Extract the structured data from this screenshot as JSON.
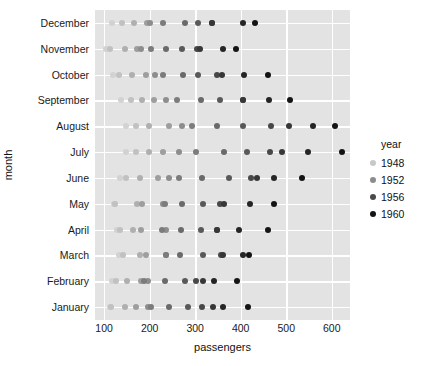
{
  "chart_data": {
    "type": "scatter",
    "plot_style": "stripplot",
    "title": "",
    "xlabel": "passengers",
    "ylabel": "month",
    "xlim": [
      80,
      640
    ],
    "xticks": [
      100,
      200,
      300,
      400,
      500,
      600
    ],
    "xticklabels": [
      "100",
      "200",
      "300",
      "400",
      "500",
      "600"
    ],
    "categories": [
      "December",
      "November",
      "October",
      "September",
      "August",
      "July",
      "June",
      "May",
      "April",
      "March",
      "February",
      "January"
    ],
    "grid": true,
    "legend": {
      "title": "year",
      "position": "right",
      "entries": [
        {
          "label": "1948",
          "color": "#c8c8c8"
        },
        {
          "label": "1952",
          "color": "#8c8c8c"
        },
        {
          "label": "1956",
          "color": "#4a4a4a"
        },
        {
          "label": "1960",
          "color": "#141414"
        }
      ]
    },
    "colors": {
      "plot_background": "#e3e3e3",
      "figure_background": "#ffffff",
      "gridline": "#ffffff",
      "text": "#111111"
    },
    "years": [
      1949,
      1950,
      1951,
      1952,
      1953,
      1954,
      1955,
      1956,
      1957,
      1958,
      1959,
      1960
    ],
    "series": [
      {
        "name": "January",
        "values": [
          112,
          115,
          145,
          171,
          196,
          204,
          242,
          284,
          315,
          340,
          360,
          417
        ]
      },
      {
        "name": "February",
        "values": [
          118,
          126,
          150,
          180,
          196,
          188,
          233,
          277,
          301,
          318,
          342,
          391
        ]
      },
      {
        "name": "March",
        "values": [
          132,
          141,
          178,
          193,
          236,
          235,
          267,
          317,
          356,
          362,
          406,
          419
        ]
      },
      {
        "name": "April",
        "values": [
          129,
          135,
          163,
          181,
          235,
          227,
          269,
          313,
          348,
          348,
          396,
          461
        ]
      },
      {
        "name": "May",
        "values": [
          121,
          125,
          172,
          183,
          229,
          234,
          270,
          318,
          355,
          363,
          420,
          472
        ]
      },
      {
        "name": "June",
        "values": [
          135,
          149,
          178,
          218,
          243,
          264,
          315,
          374,
          422,
          435,
          472,
          535
        ]
      },
      {
        "name": "July",
        "values": [
          148,
          170,
          199,
          230,
          264,
          302,
          364,
          413,
          465,
          491,
          548,
          622
        ]
      },
      {
        "name": "August",
        "values": [
          148,
          170,
          199,
          242,
          272,
          293,
          347,
          405,
          467,
          505,
          559,
          606
        ]
      },
      {
        "name": "September",
        "values": [
          136,
          158,
          184,
          209,
          237,
          259,
          312,
          355,
          404,
          404,
          463,
          508
        ]
      },
      {
        "name": "October",
        "values": [
          119,
          133,
          162,
          191,
          211,
          229,
          274,
          306,
          347,
          359,
          407,
          461
        ]
      },
      {
        "name": "November",
        "values": [
          104,
          114,
          146,
          172,
          180,
          203,
          237,
          271,
          305,
          310,
          362,
          390
        ]
      },
      {
        "name": "December",
        "values": [
          118,
          140,
          166,
          194,
          201,
          229,
          278,
          306,
          336,
          337,
          405,
          432
        ]
      }
    ]
  }
}
